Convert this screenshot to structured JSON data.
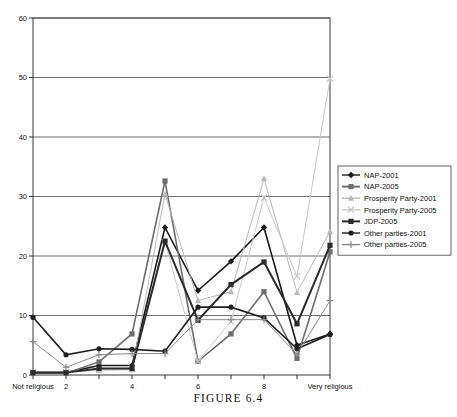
{
  "caption": "FIGURE 6.4",
  "chart_data": {
    "type": "line",
    "title": "",
    "xlabel": "",
    "ylabel": "",
    "ylim": [
      0,
      60
    ],
    "yticks": [
      0,
      10,
      20,
      30,
      40,
      50,
      60
    ],
    "grid": true,
    "legend_position": "right",
    "categories": [
      "Not religious",
      "2",
      "3",
      "4",
      "5",
      "6",
      "7",
      "8",
      "9",
      "Very religious"
    ],
    "x": [
      "Not religious",
      "2",
      "4",
      "5",
      "6",
      "7",
      "8",
      "9",
      "Very religious"
    ],
    "xtick_labels": [
      "Not religious",
      "2",
      "4",
      "6",
      "8",
      "Very religious"
    ],
    "series": [
      {
        "name": "NAP-2001",
        "color": "#1a1a1a",
        "marker": "diamond",
        "values": [
          0.4,
          0.4,
          1.6,
          1.6,
          24.8,
          14.2,
          19.1,
          24.8,
          5.0,
          6.9
        ]
      },
      {
        "name": "NAP-2005",
        "color": "#6e6e6e",
        "marker": "square",
        "values": [
          0.3,
          0.3,
          2.2,
          6.9,
          32.6,
          2.3,
          6.9,
          14.0,
          2.8,
          20.7
        ]
      },
      {
        "name": "Prosperity Party-2001",
        "color": "#b9b9b9",
        "marker": "triangle",
        "values": [
          0.5,
          0.5,
          0.8,
          0.9,
          30.4,
          12.5,
          14.0,
          33.0,
          13.9,
          24.1
        ]
      },
      {
        "name": "Prosperity Party-2005",
        "color": "#c9c9c9",
        "marker": "cross",
        "values": [
          0.5,
          0.5,
          0.9,
          1.0,
          22.3,
          2.3,
          9.0,
          29.8,
          16.6,
          49.8
        ]
      },
      {
        "name": "JDP-2005",
        "color": "#2b2b2b",
        "marker": "square",
        "values": [
          0.4,
          0.4,
          1.1,
          1.1,
          22.5,
          9.2,
          15.2,
          19.0,
          8.6,
          21.8
        ]
      },
      {
        "name": "Other parties-2001",
        "color": "#1f1f1f",
        "marker": "circle",
        "values": [
          9.7,
          3.4,
          4.4,
          4.3,
          4.0,
          11.4,
          11.4,
          9.6,
          4.4,
          6.8
        ]
      },
      {
        "name": "Other parties-2005",
        "color": "#8a8a8a",
        "marker": "plus",
        "values": [
          5.6,
          1.3,
          3.4,
          3.6,
          3.6,
          9.3,
          9.3,
          9.3,
          3.5,
          12.5
        ]
      }
    ],
    "legend_entries": [
      "NAP-2001",
      "NAP-2005",
      "Prosperity Party-2001",
      "Prosperity Party-2005",
      "JDP-2005",
      "Other parties-2001",
      "Other parties-2005"
    ]
  }
}
